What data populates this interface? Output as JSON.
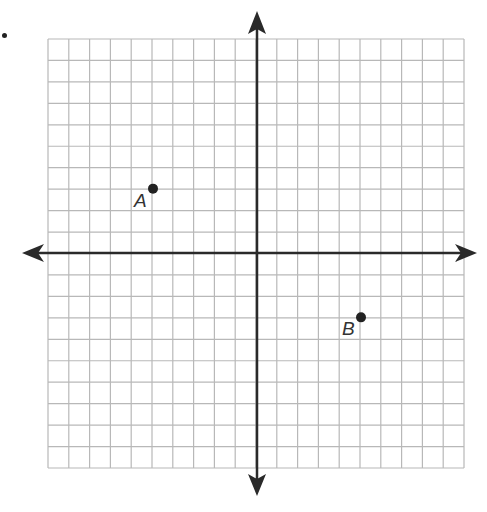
{
  "figure": {
    "type": "coordinate-plane",
    "grid": {
      "x_min": -10,
      "x_max": 10,
      "y_min": -10,
      "y_max": 10,
      "step": 1
    },
    "colors": {
      "grid": "#b8b8b8",
      "axis": "#2a2a2a",
      "point": "#222222"
    },
    "points": [
      {
        "label": "A",
        "x": -5,
        "y": 3
      },
      {
        "label": "B",
        "x": 5,
        "y": -3
      }
    ]
  }
}
